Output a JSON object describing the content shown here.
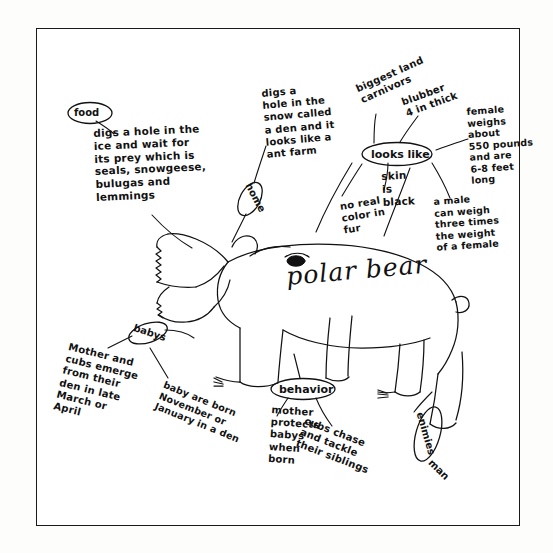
{
  "poster": {
    "subject_title": "polar bear",
    "title_position": "center-right of bear body"
  },
  "nodes": [
    {
      "id": "food",
      "label": "food"
    },
    {
      "id": "home",
      "label": "home"
    },
    {
      "id": "looks",
      "label": "looks like"
    },
    {
      "id": "baby",
      "label": "babys"
    },
    {
      "id": "behavior",
      "label": "behavior"
    },
    {
      "id": "enemies",
      "label": "enimies"
    }
  ],
  "notes": {
    "food": "digs a hole in the\nice and wait for\nits prey which is\nseals, snowgeese,\nbulugas and\nlemmings",
    "home": "digs a\nhole in the\nsnow called\na den and it\nlooks like a\nant farm",
    "carnivore": "biggest land\ncarnivors",
    "blubber": "blubber\n4 in thick",
    "female_size": "female\nweighs\nabout\n550 pounds\nand are\n6-8 feet\nlong",
    "male_size": "a male\ncan weigh\nthree times\nthe weight\nof a female",
    "skin": "skin\nis\nblack",
    "fur": "no real\ncolor in\nfur",
    "mother_emerge": "Mother and\ncubs emerge\nfrom their\nden in late\nMarch or\nApril",
    "baby_born": "baby are born\nNovember or\nJanuary in a den",
    "mother_protects": "mother\nprotects\nbabys\nwhen\nborn",
    "cubs_play": "cubs chase\nand tackle\ntheir siblings",
    "enemies_man": "man"
  },
  "drawing": {
    "name": "polar-bear-sketch",
    "description": "hand drawn side view of a polar bear with open jaws showing teeth, one eye, four legs with claws and a small tail"
  },
  "colors": {
    "ink": "#111111",
    "paper": "#ffffff",
    "page_background": "#fdfdfc"
  }
}
